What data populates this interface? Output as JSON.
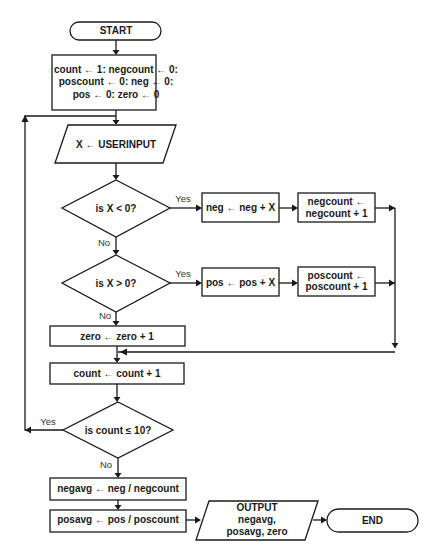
{
  "diagram": {
    "type": "flowchart",
    "nodes": {
      "start": {
        "kind": "terminator",
        "label": "START"
      },
      "init": {
        "kind": "process",
        "lines": [
          "count ← 1: negcount ← 0:",
          "poscount ← 0: neg ← 0:",
          "pos ← 0: zero ← 0"
        ]
      },
      "input": {
        "kind": "io",
        "label": "X ← USERINPUT"
      },
      "decision_neg": {
        "kind": "decision",
        "label": "is X < 0?"
      },
      "neg_sum": {
        "kind": "process",
        "label": "neg ← neg + X"
      },
      "neg_count": {
        "kind": "process",
        "lines": [
          "negcount ←",
          "negcount + 1"
        ]
      },
      "decision_pos": {
        "kind": "decision",
        "label": "is X > 0?"
      },
      "pos_sum": {
        "kind": "process",
        "label": "pos ← pos + X"
      },
      "pos_count": {
        "kind": "process",
        "lines": [
          "poscount ←",
          "poscount + 1"
        ]
      },
      "zero_count": {
        "kind": "process",
        "label": "zero ← zero + 1"
      },
      "count_inc": {
        "kind": "process",
        "label": "count ← count + 1"
      },
      "decision_loop": {
        "kind": "decision",
        "label": "is count ≤ 10?"
      },
      "negavg": {
        "kind": "process",
        "label": "negavg ← neg / negcount"
      },
      "posavg": {
        "kind": "process",
        "label": "posavg ← pos / poscount"
      },
      "output": {
        "kind": "io",
        "lines": [
          "OUTPUT",
          "negavg,",
          "posavg, zero"
        ]
      },
      "end": {
        "kind": "terminator",
        "label": "END"
      }
    },
    "edge_labels": {
      "neg_yes": "Yes",
      "neg_no": "No",
      "pos_yes": "Yes",
      "pos_no": "No",
      "loop_yes": "Yes",
      "loop_no": "No"
    },
    "edges": [
      [
        "start",
        "init"
      ],
      [
        "init",
        "input"
      ],
      [
        "input",
        "decision_neg"
      ],
      [
        "decision_neg",
        "neg_sum",
        "Yes"
      ],
      [
        "neg_sum",
        "neg_count"
      ],
      [
        "decision_neg",
        "decision_pos",
        "No"
      ],
      [
        "decision_pos",
        "pos_sum",
        "Yes"
      ],
      [
        "pos_sum",
        "pos_count"
      ],
      [
        "decision_pos",
        "zero_count",
        "No"
      ],
      [
        "neg_count",
        "count_inc"
      ],
      [
        "pos_count",
        "count_inc"
      ],
      [
        "zero_count",
        "count_inc"
      ],
      [
        "count_inc",
        "decision_loop"
      ],
      [
        "decision_loop",
        "input",
        "Yes"
      ],
      [
        "decision_loop",
        "negavg",
        "No"
      ],
      [
        "negavg",
        "posavg"
      ],
      [
        "posavg",
        "output"
      ],
      [
        "output",
        "end"
      ]
    ]
  }
}
